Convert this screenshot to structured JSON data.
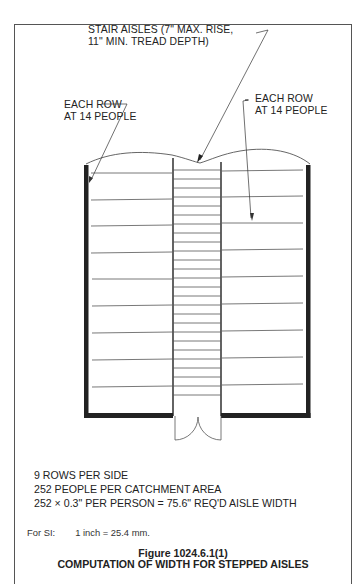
{
  "header": {
    "section_label": "Section 1024"
  },
  "diagram": {
    "callouts": {
      "stair_aisles": [
        "STAIR AISLES (7\" MAX. RISE,",
        "11\" MIN. TREAD DEPTH)"
      ],
      "left_rows": [
        "EACH ROW",
        "AT 14 PEOPLE"
      ],
      "right_rows": [
        "EACH ROW",
        "AT 14 PEOPLE"
      ]
    },
    "rows_per_side": 9,
    "people_per_row": 14
  },
  "notes": {
    "line1": "9 ROWS PER SIDE",
    "line2": "252 PEOPLE PER CATCHMENT AREA",
    "line3": "252 × 0.3\" PER PERSON = 75.6\" REQ'D AISLE WIDTH"
  },
  "si_note": {
    "label": "For SI:",
    "value": "1 inch = 25.4 mm."
  },
  "caption": {
    "figure_number": "Figure 1024.6.1(1)",
    "title": "COMPUTATION OF WIDTH FOR STEPPED AISLES"
  }
}
